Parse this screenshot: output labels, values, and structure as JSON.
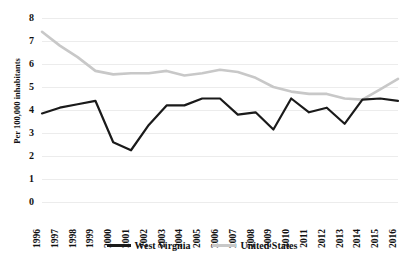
{
  "chart_data": {
    "type": "line",
    "title": "",
    "xlabel": "",
    "ylabel": "Per 100,000 inhabitants",
    "ylim": [
      0,
      8
    ],
    "ytick_step": 1,
    "yticks": [
      "8",
      "7",
      "6",
      "5",
      "4",
      "3",
      "2",
      "1",
      "0"
    ],
    "grid": true,
    "grid_axis": "y",
    "legend_position": "bottom",
    "x": [
      "1996",
      "1997",
      "1998",
      "1999",
      "2000",
      "2001",
      "2002",
      "2003",
      "2004",
      "2005",
      "2006",
      "2007",
      "2008",
      "2009",
      "2010",
      "2011",
      "2012",
      "2013",
      "2014",
      "2015",
      "2016"
    ],
    "categories": [
      "1996",
      "1997",
      "1998",
      "1999",
      "2000",
      "2001",
      "2002",
      "2003",
      "2004",
      "2005",
      "2006",
      "2007",
      "2008",
      "2009",
      "2010",
      "2011",
      "2012",
      "2013",
      "2014",
      "2015",
      "2016"
    ],
    "series": [
      {
        "name": "West Virgnia",
        "color": "#1a1a1a",
        "values": [
          3.85,
          4.1,
          4.25,
          4.4,
          2.6,
          2.25,
          3.35,
          4.2,
          4.2,
          4.5,
          4.5,
          3.8,
          3.9,
          3.15,
          4.5,
          3.9,
          4.1,
          3.4,
          4.45,
          4.5,
          4.4
        ]
      },
      {
        "name": "United States",
        "color": "#c8c8c8",
        "values": [
          7.4,
          6.8,
          6.3,
          5.7,
          5.55,
          5.6,
          5.6,
          5.7,
          5.5,
          5.6,
          5.75,
          5.65,
          5.4,
          5.0,
          4.8,
          4.7,
          4.7,
          4.5,
          4.45,
          4.9,
          5.35
        ]
      }
    ]
  },
  "legend": {
    "items": [
      {
        "label": "West Virgnia",
        "color": "#1a1a1a"
      },
      {
        "label": "United States",
        "color": "#c8c8c8"
      }
    ]
  },
  "axis": {
    "y_title": "Per 100,000 inhabitants"
  },
  "colors": {
    "grid": "#ececec",
    "background": "#ffffff",
    "text": "#111111",
    "series_west_virginia": "#1a1a1a",
    "series_united_states": "#c8c8c8"
  }
}
